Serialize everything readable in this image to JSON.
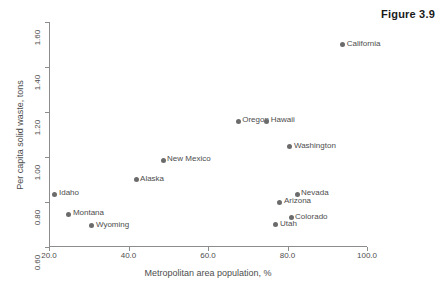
{
  "figure": {
    "caption": "Figure 3.9"
  },
  "chart_data": {
    "type": "scatter",
    "title": "Figure 3.9",
    "xlabel": "Metropolitan area population, %",
    "ylabel": "Per capita solid waste, tons",
    "xlim": [
      20.0,
      100.0
    ],
    "ylim": [
      0.6,
      1.6
    ],
    "xticks": [
      "20.0",
      "40.0",
      "60.0",
      "80.0",
      "100.0"
    ],
    "yticks": [
      "0.60",
      "0.80",
      "1.00",
      "1.20",
      "1.40",
      "1.60"
    ],
    "grid": false,
    "legend": null,
    "marker_color": "#6b6b6b",
    "axis_color": "#8c8c8c",
    "points": [
      {
        "label": "Idaho",
        "x": 21.5,
        "y": 0.835
      },
      {
        "label": "Montana",
        "x": 25.0,
        "y": 0.745
      },
      {
        "label": "Wyoming",
        "x": 30.8,
        "y": 0.695
      },
      {
        "label": "Alaska",
        "x": 41.9,
        "y": 0.9
      },
      {
        "label": "New Mexico",
        "x": 48.7,
        "y": 0.985
      },
      {
        "label": "Oregon",
        "x": 67.6,
        "y": 1.16
      },
      {
        "label": "Hawaii",
        "x": 74.8,
        "y": 1.16
      },
      {
        "label": "Utah",
        "x": 77.1,
        "y": 0.7
      },
      {
        "label": "Arizona",
        "x": 78.1,
        "y": 0.8
      },
      {
        "label": "Washington",
        "x": 80.6,
        "y": 1.045
      },
      {
        "label": "Colorado",
        "x": 80.9,
        "y": 0.73
      },
      {
        "label": "Nevada",
        "x": 82.4,
        "y": 0.835
      },
      {
        "label": "California",
        "x": 93.9,
        "y": 1.5
      }
    ]
  }
}
